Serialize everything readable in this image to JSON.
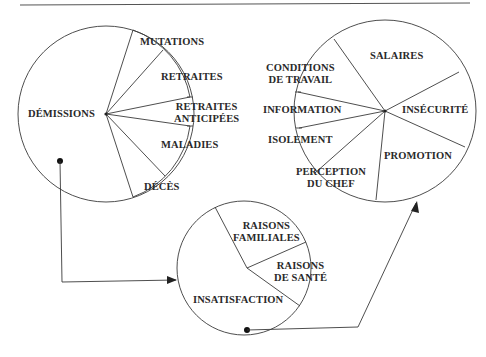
{
  "diagram": {
    "type": "pie-flow",
    "stroke_color": "#3a3a3a",
    "left_pie": {
      "name": "departures",
      "slices": [
        {
          "label": "DÉMISSIONS"
        },
        {
          "label": "MUTATIONS"
        },
        {
          "label": "RETRAITES"
        },
        {
          "label_line1": "RETRAITES",
          "label_line2": "ANTICIPÉES"
        },
        {
          "label": "MALADIES"
        },
        {
          "label": "DÉCÈS"
        }
      ]
    },
    "bottom_pie": {
      "name": "resignation-reasons",
      "slices": [
        {
          "label_line1": "RAISONS",
          "label_line2": "FAMILIALES"
        },
        {
          "label_line1": "RAISONS",
          "label_line2": "DE SANTÉ"
        },
        {
          "label": "INSATISFACTION"
        }
      ]
    },
    "right_pie": {
      "name": "dissatisfaction-reasons",
      "slices": [
        {
          "label": "SALAIRES"
        },
        {
          "label": "INSÉCURITÉ"
        },
        {
          "label": "PROMOTION"
        },
        {
          "label_line1": "PERCEPTION",
          "label_line2": "DU CHEF"
        },
        {
          "label": "ISOLEMENT"
        },
        {
          "label": "INFORMATION"
        },
        {
          "label_line1": "CONDITIONS",
          "label_line2": "DE TRAVAIL"
        }
      ]
    },
    "arrows": [
      {
        "from": "DÉMISSIONS",
        "to": "bottom_pie"
      },
      {
        "from": "INSATISFACTION",
        "to": "right_pie"
      }
    ]
  }
}
